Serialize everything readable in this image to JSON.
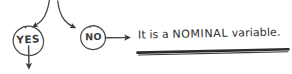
{
  "diagram": {
    "style": "hand-drawn pencil sketch",
    "background_color": "#ffffff",
    "ink_color": "#3c3c3c"
  },
  "nodes": [
    {
      "id": "yes",
      "label": "YES",
      "shape": "circle",
      "center": [
        28,
        41
      ],
      "radius": 15
    },
    {
      "id": "no",
      "label": "NO",
      "shape": "circle",
      "center": [
        93,
        38
      ],
      "radius": 13
    }
  ],
  "outcome": {
    "prefix": "It is a ",
    "emphasis": "NOMINAL",
    "suffix": " variable.",
    "full_text": "It is a NOMINAL variable.",
    "underlined": true
  },
  "connectors": [
    {
      "id": "incoming-to-yes",
      "from": "top-edge",
      "to": "yes",
      "style": "curved-arrow",
      "direction": "down-left"
    },
    {
      "id": "incoming-to-no",
      "from": "top-edge",
      "to": "no",
      "style": "curved-arrow",
      "direction": "down-right"
    },
    {
      "id": "yes-to-below",
      "from": "yes",
      "to": "bottom-edge",
      "style": "straight-arrow",
      "direction": "down"
    },
    {
      "id": "no-to-outcome",
      "from": "no",
      "to": "outcome",
      "style": "straight-arrow",
      "direction": "right"
    }
  ]
}
